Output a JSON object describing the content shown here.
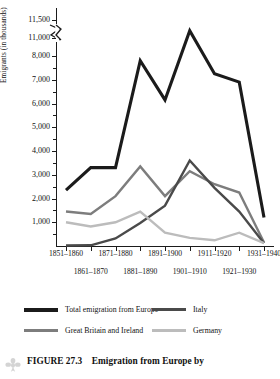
{
  "figure": {
    "caption_number": "FIGURE 27.3",
    "caption_text": "Emigration from Europe by",
    "ornament_icon": "fleuron-ornament-icon"
  },
  "chart_data": {
    "type": "line",
    "title": "",
    "xlabel": "",
    "ylabel": "Emigrants (in thousands)",
    "categories": [
      "1851–1860",
      "1861–1870",
      "1871–1880",
      "1881–1890",
      "1891–1900",
      "1901–1910",
      "1911–1920",
      "1921–1930",
      "1931–1940"
    ],
    "x_label_rows": [
      0,
      1,
      0,
      1,
      0,
      1,
      0,
      1,
      0
    ],
    "ylim": [
      0,
      11500
    ],
    "y_ticks": [
      1000,
      2000,
      3000,
      4000,
      5000,
      6000,
      7000,
      8000,
      11000,
      11500
    ],
    "y_tick_labels": [
      "1,000",
      "2,000",
      "3,000",
      "4,000",
      "5,000",
      "6,000",
      "7,000",
      "8,000",
      "11,000",
      "11,500"
    ],
    "axis_break": {
      "between": [
        8000,
        11000
      ],
      "style": "squiggle"
    },
    "grid": false,
    "legend_position": "bottom",
    "series": [
      {
        "name": "Total emigration from Europe",
        "color": "#1b1b1b",
        "width": 3.1,
        "values": [
          2350,
          3300,
          3300,
          7800,
          6150,
          11200,
          7250,
          6900,
          1200
        ]
      },
      {
        "name": "Great Britain and Ireland",
        "color": "#7d7d7d",
        "width": 2.4,
        "values": [
          1450,
          1350,
          2100,
          3350,
          2100,
          3150,
          2600,
          2250,
          150
        ]
      },
      {
        "name": "Italy",
        "color": "#4a4a4a",
        "width": 2.4,
        "values": [
          20,
          30,
          320,
          970,
          1700,
          3600,
          2450,
          1450,
          120
        ]
      },
      {
        "name": "Germany",
        "color": "#bcbcbc",
        "width": 2.4,
        "values": [
          1000,
          820,
          1000,
          1450,
          560,
          340,
          240,
          560,
          120
        ]
      }
    ]
  }
}
